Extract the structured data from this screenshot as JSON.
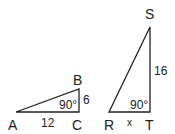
{
  "triangle_abc": {
    "vertices": {
      "A": "A",
      "B": "B",
      "C": "C"
    },
    "side_ac": "12",
    "side_bc": "6",
    "angle_c": "90°"
  },
  "triangle_rst": {
    "vertices": {
      "R": "R",
      "S": "S",
      "T": "T"
    },
    "side_rt": "x",
    "side_st": "16",
    "angle_t": "90°"
  },
  "colors": {
    "stroke": "#222222",
    "background": "#ffffff"
  }
}
